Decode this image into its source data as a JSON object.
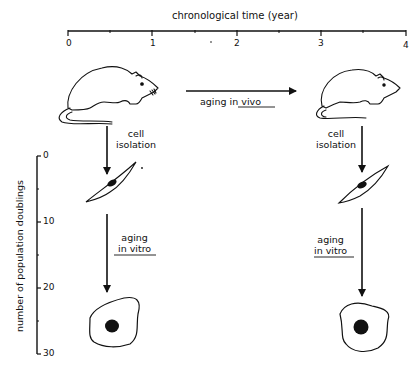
{
  "time_axis": {
    "title": "chronological time (year)",
    "ticks": [
      "0",
      "1",
      "2",
      "3",
      "4"
    ],
    "range": [
      0,
      4
    ]
  },
  "doublings_axis": {
    "title": "number of population doublings",
    "ticks": [
      "0",
      "10",
      "20",
      "30"
    ],
    "range": [
      0,
      30
    ]
  },
  "young_column": {
    "organism": "young rat",
    "isolation_label_1": "cell",
    "isolation_label_2": "isolation",
    "aging_label_1": "aging",
    "aging_label_2": "in vitro",
    "early_cell": "spindle-shaped fibroblast",
    "late_cell": "enlarged senescent cell"
  },
  "old_column": {
    "organism": "old rat",
    "isolation_label_1": "cell",
    "isolation_label_2": "isolation",
    "aging_label_1": "aging",
    "aging_label_2": "in vitro",
    "early_cell": "spindle-shaped fibroblast",
    "late_cell": "enlarged senescent cell"
  },
  "in_vivo_arrow": {
    "label_1": "aging",
    "label_2": "in vivo"
  }
}
